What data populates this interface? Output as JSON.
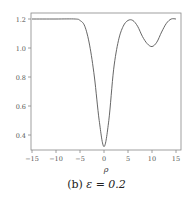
{
  "caption": {
    "label": "(b)",
    "text": "ε = 0.2"
  },
  "chart_data": {
    "type": "line",
    "title": "",
    "xlabel": "ρ",
    "ylabel": "",
    "xlim": [
      -16,
      16
    ],
    "ylim": [
      0.28,
      1.25
    ],
    "xticks": [
      -15,
      -10,
      -5,
      0,
      5,
      10,
      15
    ],
    "yticks": [
      0.4,
      0.6,
      0.8,
      1.0,
      1.2
    ],
    "grid": false,
    "legend": null,
    "line_color": "#555555",
    "series": [
      {
        "name": "curve",
        "x": [
          -15,
          -10,
          -6,
          -5,
          -4,
          -3,
          -2,
          -1,
          0,
          1,
          2,
          3,
          4,
          5,
          6,
          7,
          8,
          9,
          10,
          11,
          12,
          13,
          14,
          15
        ],
        "y": [
          1.2,
          1.2,
          1.2,
          1.19,
          1.15,
          1.02,
          0.8,
          0.5,
          0.32,
          0.5,
          0.85,
          1.05,
          1.15,
          1.19,
          1.19,
          1.15,
          1.08,
          1.03,
          1.01,
          1.04,
          1.11,
          1.17,
          1.2,
          1.2
        ]
      }
    ]
  }
}
